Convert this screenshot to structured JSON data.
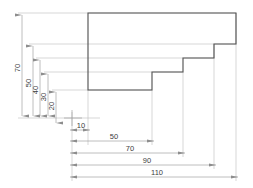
{
  "drawing": {
    "title": "stepped-profile-ordinate-dimensioned-part",
    "type": "engineering-2d-outline",
    "units": "mm",
    "colors": {
      "outline": "#555555",
      "thin_line": "#b0b0b0",
      "dimension_line": "#9a9a9a",
      "text": "#3c3c3c",
      "background": "#ffffff"
    },
    "profile": {
      "description": "Descending staircase outline, open on left and bottom",
      "vertices_mm": [
        [
          10,
          70
        ],
        [
          110,
          70
        ],
        [
          110,
          50
        ],
        [
          90,
          50
        ],
        [
          90,
          40
        ],
        [
          70,
          40
        ],
        [
          70,
          30
        ],
        [
          10,
          30
        ]
      ]
    },
    "horizontal_dimensions": [
      {
        "label": "10",
        "value": 10,
        "from_mm": 0,
        "to_mm": 10
      },
      {
        "label": "50",
        "value": 50,
        "from_mm": 0,
        "to_mm": 50
      },
      {
        "label": "70",
        "value": 70,
        "from_mm": 0,
        "to_mm": 70
      },
      {
        "label": "90",
        "value": 90,
        "from_mm": 0,
        "to_mm": 90
      },
      {
        "label": "110",
        "value": 110,
        "from_mm": 0,
        "to_mm": 110
      }
    ],
    "vertical_dimensions": [
      {
        "label": "20",
        "value": 20,
        "from_mm": 0,
        "to_mm": 20
      },
      {
        "label": "30",
        "value": 30,
        "from_mm": 0,
        "to_mm": 30
      },
      {
        "label": "40",
        "value": 40,
        "from_mm": 0,
        "to_mm": 40
      },
      {
        "label": "50",
        "value": 50,
        "from_mm": 0,
        "to_mm": 50
      },
      {
        "label": "70",
        "value": 70,
        "from_mm": 0,
        "to_mm": 70
      }
    ],
    "origin_marker": {
      "label": "",
      "x_mm": 0,
      "y_mm": 0
    }
  }
}
